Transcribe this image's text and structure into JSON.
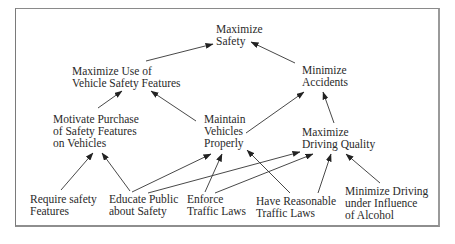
{
  "diagram": {
    "type": "objectives-hierarchy",
    "frame": {
      "border_color": "#8a8a8a",
      "background": "#ffffff"
    },
    "nodes": {
      "maximize_safety": {
        "lines": [
          "Maximize",
          "Safety"
        ]
      },
      "maximize_use_features": {
        "lines": [
          "Maximize Use of",
          "Vehicle Safety Features"
        ]
      },
      "minimize_accidents": {
        "lines": [
          "Minimize",
          "Accidents"
        ]
      },
      "motivate_purchase": {
        "lines": [
          "Motivate Purchase",
          "of Safety Features",
          "on Vehicles"
        ]
      },
      "maintain_vehicles": {
        "lines": [
          "Maintain",
          "Vehicles",
          "Properly"
        ]
      },
      "maximize_driving_quality": {
        "lines": [
          "Maximize",
          "Driving Quality"
        ]
      },
      "require_safety_features": {
        "lines": [
          "Require safety",
          "Features"
        ]
      },
      "educate_public": {
        "lines": [
          "Educate Public",
          "about Safety"
        ]
      },
      "enforce_traffic_laws": {
        "lines": [
          "Enforce",
          "Traffic Laws"
        ]
      },
      "reasonable_traffic_laws": {
        "lines": [
          "Have Reasonable",
          "Traffic Laws"
        ]
      },
      "minimize_dui": {
        "lines": [
          "Minimize Driving",
          "under Influence",
          "of Alcohol"
        ]
      }
    },
    "edges": [
      {
        "from": "maximize_use_features",
        "to": "maximize_safety"
      },
      {
        "from": "minimize_accidents",
        "to": "maximize_safety"
      },
      {
        "from": "motivate_purchase",
        "to": "maximize_use_features"
      },
      {
        "from": "maintain_vehicles",
        "to": "maximize_use_features"
      },
      {
        "from": "maintain_vehicles",
        "to": "minimize_accidents"
      },
      {
        "from": "maximize_driving_quality",
        "to": "minimize_accidents"
      },
      {
        "from": "require_safety_features",
        "to": "motivate_purchase"
      },
      {
        "from": "educate_public",
        "to": "motivate_purchase"
      },
      {
        "from": "educate_public",
        "to": "maintain_vehicles"
      },
      {
        "from": "educate_public",
        "to": "maximize_driving_quality"
      },
      {
        "from": "enforce_traffic_laws",
        "to": "maintain_vehicles"
      },
      {
        "from": "enforce_traffic_laws",
        "to": "maximize_driving_quality"
      },
      {
        "from": "reasonable_traffic_laws",
        "to": "maintain_vehicles"
      },
      {
        "from": "reasonable_traffic_laws",
        "to": "maximize_driving_quality"
      },
      {
        "from": "minimize_dui",
        "to": "maximize_driving_quality"
      }
    ]
  }
}
